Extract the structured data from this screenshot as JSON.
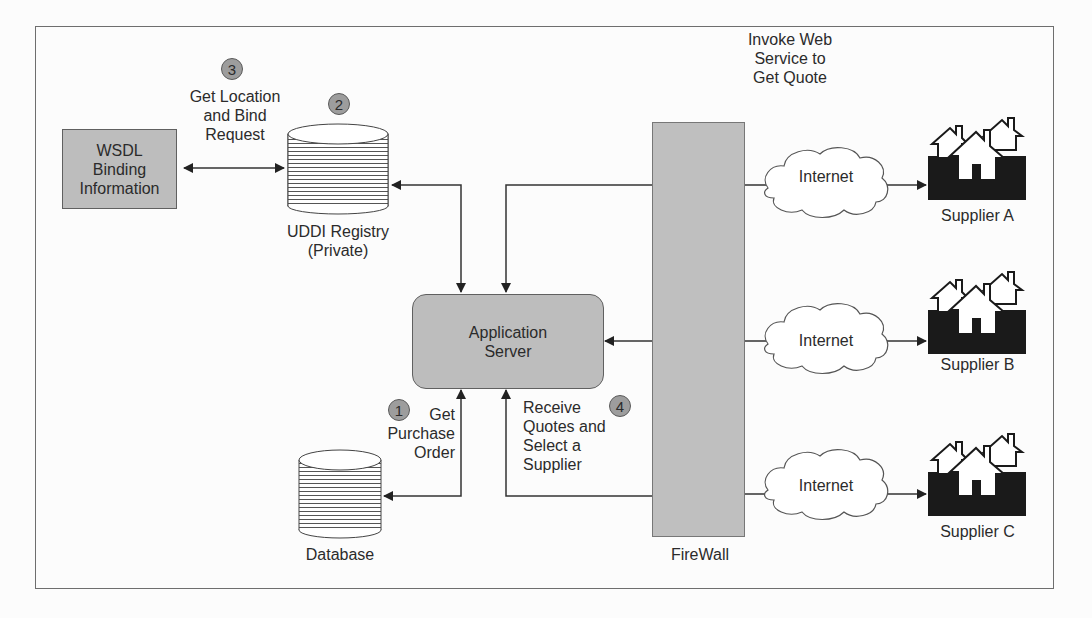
{
  "diagram": {
    "nodes": {
      "wsdl": {
        "line1": "WSDL",
        "line2": "Binding",
        "line3": "Information"
      },
      "uddi": {
        "line1": "UDDI Registry",
        "line2": "(Private)"
      },
      "app_server": {
        "line1": "Application",
        "line2": "Server"
      },
      "database": {
        "label": "Database"
      },
      "firewall": {
        "label": "FireWall"
      },
      "internet": [
        {
          "label": "Internet"
        },
        {
          "label": "Internet"
        },
        {
          "label": "Internet"
        }
      ],
      "suppliers": [
        {
          "label": "Supplier A"
        },
        {
          "label": "Supplier B"
        },
        {
          "label": "Supplier C"
        }
      ]
    },
    "steps": [
      {
        "number": "1",
        "line1": "Get",
        "line2": "Purchase",
        "line3": "Order"
      },
      {
        "number": "2"
      },
      {
        "number": "3",
        "line1": "Get Location",
        "line2": "and Bind",
        "line3": "Request"
      },
      {
        "number": "4",
        "line1": "Receive",
        "line2": "Quotes and",
        "line3": "Select a",
        "line4": "Supplier"
      }
    ],
    "annotation": {
      "line1": "Invoke Web",
      "line2": "Service to",
      "line3": "Get Quote"
    },
    "colors": {
      "box_fill": "#bdbdbd",
      "badge_fill": "#9d9d9d",
      "line": "#333333",
      "supplier_fill": "#1a1a1a"
    }
  }
}
